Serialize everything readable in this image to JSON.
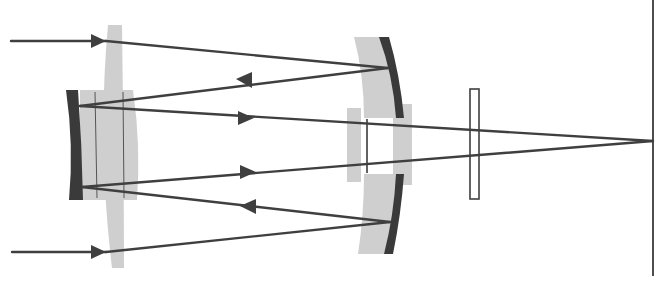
{
  "diagram": {
    "colors": {
      "ray": "#3f3f3f",
      "glass": "#cfcfcf",
      "mirror": "#3a3a3a",
      "background": "#ffffff"
    },
    "components": [
      {
        "id": "corrector-lens",
        "label": ""
      },
      {
        "id": "secondary-mirror",
        "label": ""
      },
      {
        "id": "primary-mirror",
        "label": ""
      },
      {
        "id": "field-lens-group",
        "label": ""
      },
      {
        "id": "filter-plate",
        "label": ""
      },
      {
        "id": "focal-plane",
        "label": ""
      }
    ],
    "rays": {
      "count": 2,
      "arrow_directions": [
        "right",
        "right",
        "left",
        "right",
        "right",
        "left"
      ]
    }
  }
}
